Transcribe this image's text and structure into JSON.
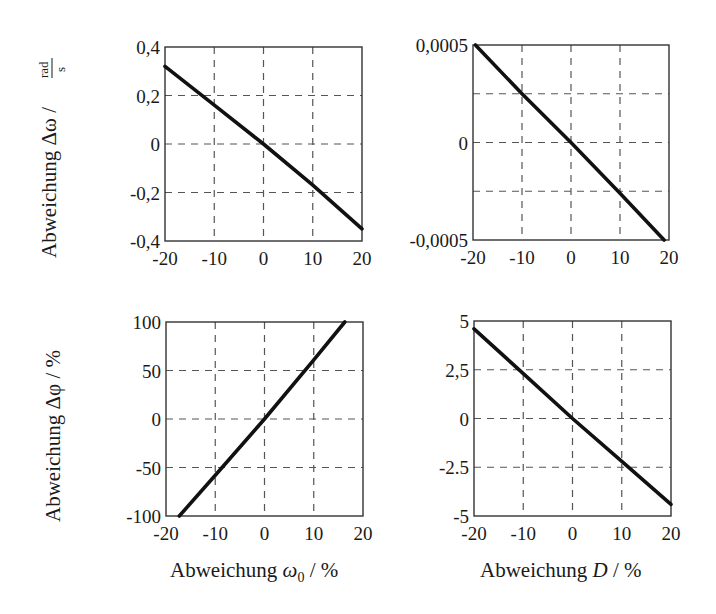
{
  "figure": {
    "background": "#ffffff",
    "line_color": "#111111",
    "grid_color": "#555555"
  },
  "chart_data": [
    {
      "id": "top-left",
      "type": "line",
      "title": "",
      "xlabel": "",
      "ylabel": "Abweichung Δω / rad/s",
      "ylabel_main": "Abweichung Δω /",
      "ylabel_unit_num": "rad",
      "ylabel_unit_den": "s",
      "xlim": [
        -20,
        20
      ],
      "ylim": [
        -0.4,
        0.4
      ],
      "xticks": [
        -20,
        -10,
        0,
        10,
        20
      ],
      "xtick_labels": [
        "-20",
        "-10",
        "0",
        "10",
        "20"
      ],
      "yticks": [
        -0.4,
        -0.2,
        0,
        0.2,
        0.4
      ],
      "ytick_labels": [
        "-0,4",
        "-0,2",
        "0",
        "0,2",
        "0,4"
      ],
      "grid": true,
      "series": [
        {
          "name": "Δω",
          "x": [
            -20,
            -10,
            0,
            10,
            20
          ],
          "y": [
            0.32,
            0.16,
            0.0,
            -0.17,
            -0.35
          ]
        }
      ],
      "box": {
        "x": 165,
        "y": 47,
        "w": 197,
        "h": 194
      }
    },
    {
      "id": "top-right",
      "type": "line",
      "title": "",
      "xlabel": "",
      "ylabel": "",
      "xlim": [
        -20,
        20
      ],
      "ylim": [
        -0.0005,
        0.0005
      ],
      "xticks": [
        -20,
        -10,
        0,
        10,
        20
      ],
      "xtick_labels": [
        "-20",
        "-10",
        "0",
        "10",
        "20"
      ],
      "yticks": [
        -0.0005,
        -0.00025,
        0,
        0.00025,
        0.0005
      ],
      "ytick_labels": [
        "-0,0005",
        "",
        "0",
        "",
        "0,0005"
      ],
      "grid": true,
      "series": [
        {
          "name": "Δω",
          "x": [
            -19.5,
            -10,
            0,
            10,
            19
          ],
          "y": [
            0.0005,
            0.00025,
            0.0,
            -0.00026,
            -0.0005
          ]
        }
      ],
      "box": {
        "x": 473,
        "y": 45,
        "w": 196,
        "h": 195
      }
    },
    {
      "id": "bottom-left",
      "type": "line",
      "title": "",
      "xlabel": "Abweichung ω0 / %",
      "xlabel_main": "Abweichung ",
      "xlabel_sym": "ω",
      "xlabel_sub": "0",
      "xlabel_unit": " / %",
      "ylabel": "Abweichung Δφ / %",
      "xlim": [
        -20,
        20
      ],
      "ylim": [
        -100,
        100
      ],
      "xticks": [
        -20,
        -10,
        0,
        10,
        20
      ],
      "xtick_labels": [
        "-20",
        "-10",
        "0",
        "10",
        "20"
      ],
      "yticks": [
        -100,
        -50,
        0,
        50,
        100
      ],
      "ytick_labels": [
        "-100",
        "-50",
        "0",
        "50",
        "100"
      ],
      "grid": true,
      "series": [
        {
          "name": "Δφ",
          "x": [
            -17.3,
            -10,
            0,
            10,
            16.3
          ],
          "y": [
            -100,
            -58,
            0,
            61,
            100
          ]
        }
      ],
      "box": {
        "x": 166,
        "y": 322,
        "w": 197,
        "h": 194
      }
    },
    {
      "id": "bottom-right",
      "type": "line",
      "title": "",
      "xlabel": "Abweichung D / %",
      "xlabel_main": "Abweichung ",
      "xlabel_sym": "D",
      "xlabel_unit": " / %",
      "ylabel": "",
      "xlim": [
        -20,
        20
      ],
      "ylim": [
        -5,
        5
      ],
      "xticks": [
        -20,
        -10,
        0,
        10,
        20
      ],
      "xtick_labels": [
        "-20",
        "-10",
        "0",
        "10",
        "20"
      ],
      "yticks": [
        -5,
        -2.5,
        0,
        2.5,
        5
      ],
      "ytick_labels": [
        "-5",
        "-2.5",
        "0",
        "2,5",
        "5"
      ],
      "grid": true,
      "series": [
        {
          "name": "Δφ",
          "x": [
            -20,
            -10,
            0,
            10,
            20
          ],
          "y": [
            4.6,
            2.3,
            0.0,
            -2.2,
            -4.4
          ]
        }
      ],
      "box": {
        "x": 474,
        "y": 321,
        "w": 197,
        "h": 195
      }
    }
  ]
}
